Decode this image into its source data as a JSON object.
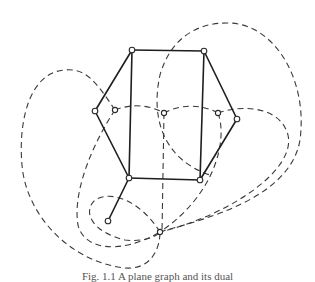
{
  "figure": {
    "type": "graph-with-dual",
    "colors": {
      "primal": "#1e1e1e",
      "dual": "#3a3a3a",
      "node_fill": "#ffffff"
    },
    "primal_vertices": [
      {
        "id": "A",
        "x": 132,
        "y": 50
      },
      {
        "id": "B",
        "x": 204,
        "y": 51
      },
      {
        "id": "C",
        "x": 237,
        "y": 119
      },
      {
        "id": "D",
        "x": 200,
        "y": 180
      },
      {
        "id": "E",
        "x": 129,
        "y": 178
      },
      {
        "id": "F",
        "x": 95,
        "y": 111
      },
      {
        "id": "T",
        "x": 108,
        "y": 221
      }
    ],
    "primal_edges": [
      [
        "A",
        "B"
      ],
      [
        "B",
        "C"
      ],
      [
        "C",
        "D"
      ],
      [
        "D",
        "E"
      ],
      [
        "E",
        "F"
      ],
      [
        "F",
        "A"
      ],
      [
        "A",
        "E"
      ],
      [
        "B",
        "D"
      ],
      [
        "E",
        "T"
      ]
    ],
    "dual_vertices": [
      {
        "id": "d1",
        "x": 115,
        "y": 110
      },
      {
        "id": "d2",
        "x": 164,
        "y": 113
      },
      {
        "id": "d3",
        "x": 218,
        "y": 113
      },
      {
        "id": "d4",
        "x": 160,
        "y": 232
      }
    ],
    "caption": "Fig. 1.1  A plane graph and its dual"
  }
}
